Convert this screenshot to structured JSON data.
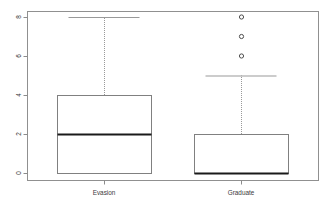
{
  "chart_data": {
    "type": "box",
    "title": "",
    "xlabel": "",
    "ylabel": "",
    "ylim": [
      0,
      8
    ],
    "yticks": [
      0,
      2,
      4,
      6,
      8
    ],
    "ytick_labels": [
      "0",
      "2",
      "4",
      "6",
      "8"
    ],
    "ytick_label_rotation": 90,
    "grid": false,
    "legend": false,
    "frame": true,
    "categories": [
      "Evasion",
      "Graduate"
    ],
    "boxes": [
      {
        "name": "Evasion",
        "q1": 0,
        "median": 2,
        "q3": 4,
        "whisker_low": 0,
        "whisker_high": 8,
        "outliers": []
      },
      {
        "name": "Graduate",
        "q1": 0,
        "median": 0,
        "q3": 2,
        "whisker_low": 0,
        "whisker_high": 5,
        "outliers": [
          6,
          7,
          8
        ]
      }
    ]
  },
  "style": {
    "frame_color": "#909090",
    "box_color": "#808080",
    "median_color": "#1a1a1a",
    "whisker_color": "#999999",
    "outlier_color": "#4d4d4d",
    "tick_color": "#8c8c8c",
    "label_color": "#3a3a3a",
    "background": "#ffffff"
  },
  "geometry": {
    "plot_left": 27,
    "plot_right": 318,
    "plot_top": 11,
    "plot_bottom": 180,
    "value_top_y": 17,
    "value_bottom_y": 173,
    "value_top": 8,
    "value_bottom": 0,
    "box_half_width": 47,
    "centers": [
      104,
      241
    ],
    "outlier_radius": 2.1
  }
}
